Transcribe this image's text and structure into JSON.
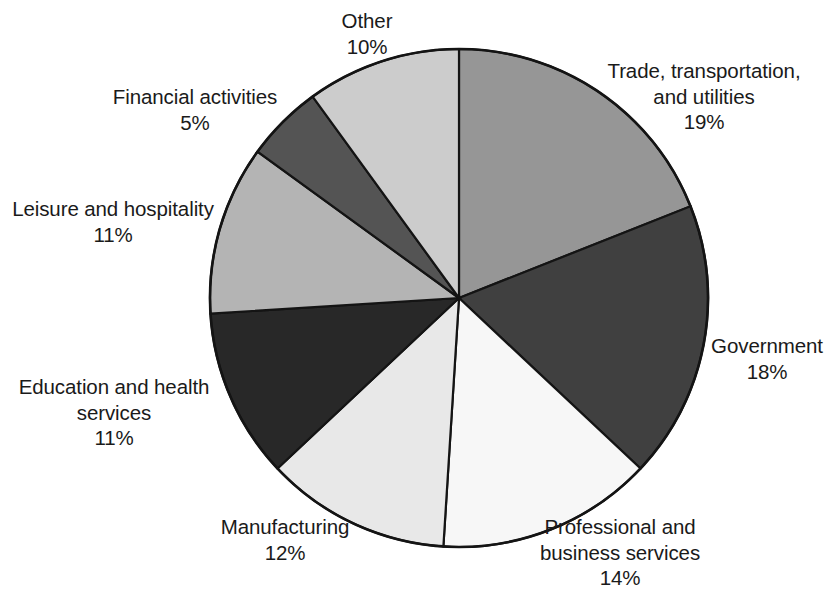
{
  "chart_data": {
    "type": "pie",
    "title": "",
    "subtitle": "",
    "xlabel": "",
    "ylabel": "",
    "legend_position": "none",
    "grid": false,
    "value_unit": "%",
    "start_angle_deg": 0,
    "direction": "clockwise",
    "categories": [
      "Trade, transportation, and utilities",
      "Government",
      "Professional and business services",
      "Manufacturing",
      "Education and health services",
      "Leisure and hospitality",
      "Financial activities",
      "Other"
    ],
    "values": [
      19,
      18,
      14,
      12,
      11,
      11,
      5,
      10
    ],
    "colors": [
      "#969696",
      "#404040",
      "#f7f7f7",
      "#e8e8e8",
      "#282828",
      "#b4b4b4",
      "#545454",
      "#cccccc"
    ],
    "slices": [
      {
        "label": "Trade, transportation, and utilities",
        "value": 19,
        "value_text": "19%",
        "color": "#969696"
      },
      {
        "label": "Government",
        "value": 18,
        "value_text": "18%",
        "color": "#404040"
      },
      {
        "label": "Professional and business services",
        "value": 14,
        "value_text": "14%",
        "color": "#f7f7f7"
      },
      {
        "label": "Manufacturing",
        "value": 12,
        "value_text": "12%",
        "color": "#e8e8e8"
      },
      {
        "label": "Education and health services",
        "value": 11,
        "value_text": "11%",
        "color": "#282828"
      },
      {
        "label": "Leisure and hospitality",
        "value": 11,
        "value_text": "11%",
        "color": "#b4b4b4"
      },
      {
        "label": "Financial activities",
        "value": 5,
        "value_text": "5%",
        "color": "#545454"
      },
      {
        "label": "Other",
        "value": 10,
        "value_text": "10%",
        "color": "#cccccc"
      }
    ]
  },
  "labels": {
    "other": {
      "line1": "Other",
      "line2": "10%"
    },
    "financial": {
      "line1": "Financial activities",
      "line2": "5%"
    },
    "leisure": {
      "line1": "Leisure and hospitality",
      "line2": "11%"
    },
    "education": {
      "line1": "Education and health",
      "line2": "services",
      "line3": "11%"
    },
    "manufacturing": {
      "line1": "Manufacturing",
      "line2": "12%"
    },
    "professional": {
      "line1": "Professional and",
      "line2": "business services",
      "line3": "14%"
    },
    "government": {
      "line1": "Government",
      "line2": "18%"
    },
    "trade": {
      "line1": "Trade, transportation,",
      "line2": "and utilities",
      "line3": "19%"
    }
  },
  "geometry": {
    "center_x": 459,
    "center_y": 298,
    "radius": 249
  }
}
